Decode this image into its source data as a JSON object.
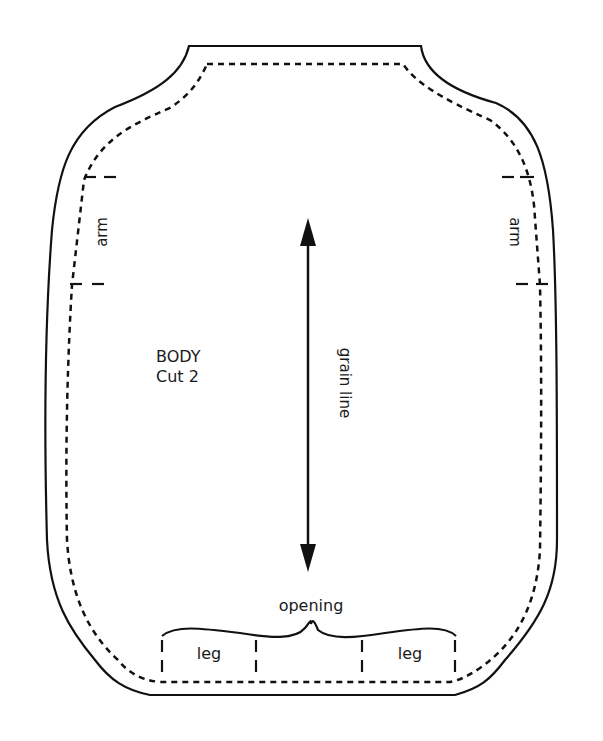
{
  "pattern": {
    "piece_label_line1": "BODY",
    "piece_label_line2": "Cut 2",
    "grain_line_label": "grain line",
    "arm_left_label": "arm",
    "arm_right_label": "arm",
    "opening_label": "opening",
    "leg_left_label": "leg",
    "leg_right_label": "leg"
  },
  "colors": {
    "stroke": "#111111",
    "background": "#ffffff"
  }
}
